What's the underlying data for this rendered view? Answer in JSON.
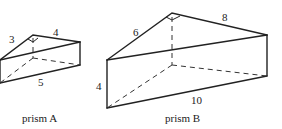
{
  "prismA": {
    "caption": "prism A",
    "labels": {
      "side1": "3",
      "side2": "4",
      "hyp": "5"
    }
  },
  "prismB": {
    "caption": "prism B",
    "labels": {
      "side1": "6",
      "side2": "8",
      "hyp": "10",
      "height": "4"
    }
  }
}
